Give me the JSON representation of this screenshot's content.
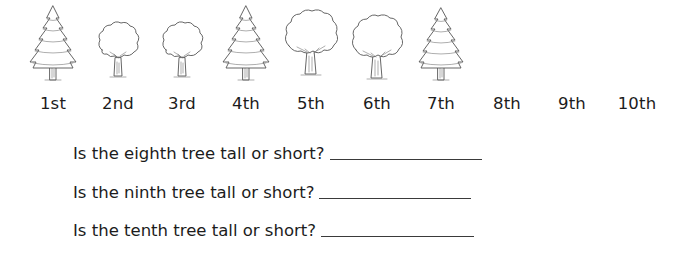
{
  "worksheet": {
    "trees": [
      {
        "position": 1,
        "label": "1st",
        "type": "pine",
        "size": "tall",
        "center_x": 53
      },
      {
        "position": 2,
        "label": "2nd",
        "type": "oak",
        "size": "short",
        "center_x": 118
      },
      {
        "position": 3,
        "label": "3rd",
        "type": "oak",
        "size": "short",
        "center_x": 182
      },
      {
        "position": 4,
        "label": "4th",
        "type": "pine",
        "size": "tall",
        "center_x": 246
      },
      {
        "position": 5,
        "label": "5th",
        "type": "oak",
        "size": "big",
        "center_x": 311
      },
      {
        "position": 6,
        "label": "6th",
        "type": "oak",
        "size": "big",
        "center_x": 377
      },
      {
        "position": 7,
        "label": "7th",
        "type": "pine",
        "size": "tall",
        "center_x": 441
      },
      {
        "position": 8,
        "label": "8th",
        "type": "blank",
        "size": "",
        "center_x": 507
      },
      {
        "position": 9,
        "label": "9th",
        "type": "blank",
        "size": "",
        "center_x": 572
      },
      {
        "position": 10,
        "label": "10th",
        "type": "blank",
        "size": "",
        "center_x": 637
      }
    ],
    "questions": [
      {
        "text": "Is the eighth tree tall or short?",
        "answer": "",
        "line_width": 152
      },
      {
        "text": "Is the ninth tree tall or short?",
        "answer": "",
        "line_width": 152
      },
      {
        "text": "Is the tenth tree tall or short?",
        "answer": "",
        "line_width": 153
      }
    ],
    "colors": {
      "text": "#1c1c1c",
      "line_art": "#555555",
      "background": "#ffffff"
    }
  }
}
